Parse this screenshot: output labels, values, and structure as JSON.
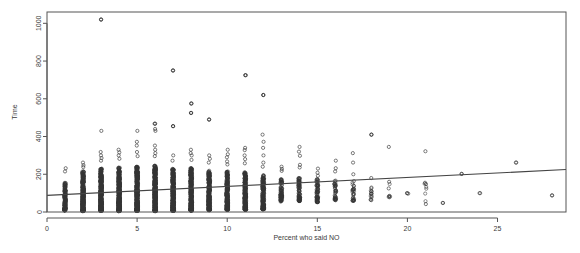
{
  "chart_data": {
    "type": "scatter",
    "title": "",
    "xlabel": "Percent who said NO",
    "ylabel": "Time",
    "xlim": [
      0,
      28.8
    ],
    "ylim": [
      0,
      1060
    ],
    "xticks": [
      0,
      5,
      10,
      15,
      20,
      25
    ],
    "yticks": [
      0,
      200,
      400,
      600,
      800,
      1000
    ],
    "xtick_labels": [
      "0",
      "5",
      "10",
      "15",
      "20",
      "25"
    ],
    "ytick_labels": [
      "0",
      "200",
      "400",
      "600",
      "800",
      "1000"
    ],
    "grid": false,
    "legend": null,
    "marker": "open-circle",
    "marker_color": "#333333",
    "marker_radius": 1.6,
    "box": true,
    "box_color": "#555555",
    "trendline": {
      "type": "linear-regression",
      "color": "#444444",
      "width": 1.1,
      "x0": 0,
      "y0": 88,
      "x1": 28.8,
      "y1": 225
    },
    "columns": [
      {
        "x": 1,
        "n": 150,
        "y_min": 8,
        "y_max": 200,
        "y_dense_max": 155,
        "outliers": [
          232,
          215
        ]
      },
      {
        "x": 2,
        "n": 330,
        "y_min": 5,
        "y_max": 290,
        "y_dense_max": 215,
        "outliers": [
          262,
          248,
          238
        ]
      },
      {
        "x": 3,
        "n": 420,
        "y_min": 6,
        "y_max": 330,
        "y_dense_max": 230,
        "outliers": [
          1020,
          430,
          318,
          300,
          286,
          272
        ]
      },
      {
        "x": 4,
        "n": 430,
        "y_min": 5,
        "y_max": 340,
        "y_dense_max": 235,
        "outliers": [
          330,
          316,
          300,
          282
        ]
      },
      {
        "x": 5,
        "n": 430,
        "y_min": 6,
        "y_max": 355,
        "y_dense_max": 240,
        "outliers": [
          430,
          372,
          352,
          318,
          296
        ]
      },
      {
        "x": 6,
        "n": 440,
        "y_min": 5,
        "y_max": 360,
        "y_dense_max": 245,
        "outliers": [
          468,
          440,
          430,
          352,
          330,
          312,
          296
        ]
      },
      {
        "x": 7,
        "n": 380,
        "y_min": 7,
        "y_max": 300,
        "y_dense_max": 230,
        "outliers": [
          750,
          455,
          300,
          272
        ]
      },
      {
        "x": 8,
        "n": 360,
        "y_min": 8,
        "y_max": 330,
        "y_dense_max": 235,
        "outliers": [
          575,
          525,
          330,
          312,
          300,
          276
        ]
      },
      {
        "x": 9,
        "n": 300,
        "y_min": 10,
        "y_max": 300,
        "y_dense_max": 220,
        "outliers": [
          490,
          300,
          282,
          262
        ]
      },
      {
        "x": 10,
        "n": 280,
        "y_min": 12,
        "y_max": 330,
        "y_dense_max": 215,
        "outliers": [
          330,
          306,
          290,
          268,
          252
        ]
      },
      {
        "x": 11,
        "n": 250,
        "y_min": 12,
        "y_max": 340,
        "y_dense_max": 210,
        "outliers": [
          725,
          340,
          328,
          300,
          280,
          258
        ]
      },
      {
        "x": 12,
        "n": 180,
        "y_min": 15,
        "y_max": 260,
        "y_dense_max": 195,
        "outliers": [
          620,
          410,
          372,
          340,
          300,
          262,
          240
        ]
      },
      {
        "x": 13,
        "n": 90,
        "y_min": 55,
        "y_max": 240,
        "y_dense_max": 175,
        "outliers": [
          240,
          228,
          218
        ]
      },
      {
        "x": 14,
        "n": 80,
        "y_min": 58,
        "y_max": 250,
        "y_dense_max": 180,
        "outliers": [
          345,
          320,
          298,
          250,
          236
        ]
      },
      {
        "x": 15,
        "n": 70,
        "y_min": 52,
        "y_max": 230,
        "y_dense_max": 175,
        "outliers": [
          230,
          208,
          192
        ]
      },
      {
        "x": 16,
        "n": 40,
        "y_min": 62,
        "y_max": 215,
        "y_dense_max": 170,
        "outliers": [
          272,
          232,
          215
        ]
      },
      {
        "x": 17,
        "n": 30,
        "y_min": 60,
        "y_max": 200,
        "y_dense_max": 165,
        "outliers": [
          312,
          262,
          200
        ]
      },
      {
        "x": 18,
        "n": 12,
        "y_min": 62,
        "y_max": 180,
        "y_dense_max": 140,
        "outliers": [
          410,
          180,
          108,
          96
        ]
      },
      {
        "x": 19,
        "n": 6,
        "y_min": 78,
        "y_max": 160,
        "y_dense_max": 150,
        "outliers": [
          345,
          160,
          125
        ]
      },
      {
        "x": 20,
        "n": 2,
        "y_min": 96,
        "y_max": 100,
        "y_dense_max": 100,
        "outliers": [
          100
        ]
      },
      {
        "x": 21,
        "n": 5,
        "y_min": 42,
        "y_max": 322,
        "y_dense_max": 155,
        "outliers": [
          322,
          155,
          148,
          42
        ]
      },
      {
        "x": 22,
        "n": 1,
        "y_min": 48,
        "y_max": 48,
        "y_dense_max": 48,
        "outliers": [
          48
        ]
      },
      {
        "x": 23,
        "n": 1,
        "y_min": 202,
        "y_max": 202,
        "y_dense_max": 202,
        "outliers": [
          202
        ]
      },
      {
        "x": 24,
        "n": 1,
        "y_min": 100,
        "y_max": 100,
        "y_dense_max": 100,
        "outliers": [
          100
        ]
      },
      {
        "x": 26,
        "n": 1,
        "y_min": 262,
        "y_max": 262,
        "y_dense_max": 262,
        "outliers": [
          262
        ]
      },
      {
        "x": 28,
        "n": 1,
        "y_min": 88,
        "y_max": 88,
        "y_dense_max": 88,
        "outliers": [
          88
        ]
      }
    ],
    "notable_points": [
      {
        "x": 3,
        "y": 1020,
        "note": "maximum"
      },
      {
        "x": 7,
        "y": 750
      },
      {
        "x": 11,
        "y": 725
      },
      {
        "x": 12,
        "y": 620
      },
      {
        "x": 8,
        "y": 575
      },
      {
        "x": 8,
        "y": 525
      },
      {
        "x": 9,
        "y": 490
      },
      {
        "x": 6,
        "y": 468
      },
      {
        "x": 7,
        "y": 455
      },
      {
        "x": 18,
        "y": 410
      }
    ]
  }
}
